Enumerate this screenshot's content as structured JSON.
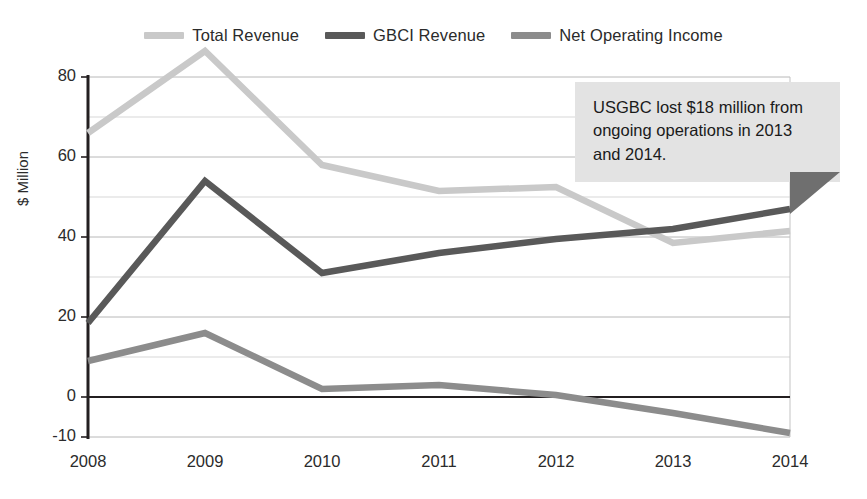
{
  "chart_data": {
    "type": "line",
    "title": "",
    "xlabel": "",
    "ylabel": "$ Million",
    "x": [
      "2008",
      "2009",
      "2010",
      "2011",
      "2012",
      "2013",
      "2014"
    ],
    "categories": [
      "2008",
      "2009",
      "2010",
      "2011",
      "2012",
      "2013",
      "2014"
    ],
    "series": [
      {
        "name": "Total Revenue",
        "color": "#c9c9c9",
        "values": [
          66,
          86.5,
          58,
          51.5,
          52.5,
          38.5,
          41.5
        ]
      },
      {
        "name": "GBCI Revenue",
        "color": "#595959",
        "values": [
          18.5,
          54,
          31,
          36,
          39.5,
          42,
          47
        ]
      },
      {
        "name": "Net Operating Income",
        "color": "#8c8c8c",
        "values": [
          9,
          16,
          2,
          3,
          0.5,
          -4,
          -9
        ]
      }
    ],
    "ylim": [
      -10,
      80
    ],
    "yticks": [
      80,
      60,
      40,
      20,
      0,
      -10
    ],
    "ytick_labels": [
      "80",
      "60",
      "40",
      "20",
      "0",
      "-10"
    ],
    "minor_gridlines": [
      70,
      50,
      30,
      10,
      -10
    ],
    "grid": true,
    "legend_position": "top-center",
    "zero_line": 0,
    "annotations": [
      {
        "text": "USGBC lost $18 million from ongoing operations in 2013 and 2014.",
        "background": "#e3e3e3",
        "tail_color": "#6f6f6f"
      }
    ]
  },
  "legend": {
    "items": [
      {
        "label": "Total Revenue",
        "color": "#c9c9c9"
      },
      {
        "label": "GBCI Revenue",
        "color": "#595959"
      },
      {
        "label": "Net Operating Income",
        "color": "#8c8c8c"
      }
    ]
  },
  "axes": {
    "y_title": "$ Million",
    "y_labels": [
      "80",
      "60",
      "40",
      "20",
      "0",
      "-10"
    ],
    "x_labels": [
      "2008",
      "2009",
      "2010",
      "2011",
      "2012",
      "2013",
      "2014"
    ]
  },
  "callout": {
    "text": "USGBC lost $18 million from ongoing operations in 2013 and 2014."
  }
}
